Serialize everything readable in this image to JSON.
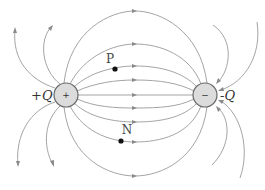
{
  "diagram": {
    "charges": [
      {
        "id": "positive",
        "label": "+Q",
        "sign": "+",
        "cx": 66,
        "cy": 95,
        "r": 12
      },
      {
        "id": "negative",
        "label": "-Q",
        "sign": "−",
        "cx": 205,
        "cy": 95,
        "r": 12
      }
    ],
    "points": [
      {
        "id": "P",
        "label": "P",
        "x": 115,
        "y": 69
      },
      {
        "id": "N",
        "label": "N",
        "x": 121,
        "y": 141
      }
    ],
    "colors": {
      "field_line": "#9a9a9a",
      "charge_fill": "#dcdcdc",
      "charge_stroke": "#6a6a6a",
      "point": "#111111"
    },
    "field_line_direction": "from +Q to -Q"
  }
}
